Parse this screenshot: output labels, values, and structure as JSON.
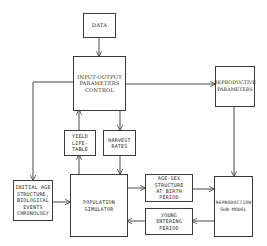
{
  "diagram": {
    "nodes": {
      "data": {
        "label": "DATA"
      },
      "io_control": {
        "label": "INPUT-OUTPUT\nPARAMETERS\nCONTROL"
      },
      "reproductive_params": {
        "label": "REPRODUCTIVE\nPARAMETERS"
      },
      "yield_life_table": {
        "label": "YIELD\nLIFE-TABLE"
      },
      "harvest_rates": {
        "label": "HARVEST\nRATES"
      },
      "initial_age": {
        "label": "INITIAL AGE\nSTRUCTURE,\nBIOLOGICAL\nEVENTS\nCHRONOLOGY"
      },
      "population_simulator": {
        "label": "POPULATION\nSIMULATOR"
      },
      "age_sex_structure": {
        "label": "AGE-SEX\nSTRUCTURE\nAT BIRTH\nPERIOD"
      },
      "young_entering": {
        "label": "YOUNG\nENTERING\nPERIOD"
      },
      "reproduction_submodel": {
        "label": "REPRODUCTION\nSUB-MODEL"
      }
    },
    "edges": [
      {
        "from": "data",
        "to": "io_control"
      },
      {
        "from": "io_control",
        "to": "reproductive_params"
      },
      {
        "from": "io_control",
        "to": "initial_age"
      },
      {
        "from": "yield_life_table",
        "to": "io_control"
      },
      {
        "from": "io_control",
        "to": "harvest_rates"
      },
      {
        "from": "population_simulator",
        "to": "yield_life_table"
      },
      {
        "from": "harvest_rates",
        "to": "population_simulator"
      },
      {
        "from": "initial_age",
        "to": "population_simulator"
      },
      {
        "from": "population_simulator",
        "to": "age_sex_structure"
      },
      {
        "from": "age_sex_structure",
        "to": "reproduction_submodel"
      },
      {
        "from": "reproductive_params",
        "to": "reproduction_submodel"
      },
      {
        "from": "reproduction_submodel",
        "to": "young_entering"
      },
      {
        "from": "young_entering",
        "to": "population_simulator"
      }
    ]
  }
}
